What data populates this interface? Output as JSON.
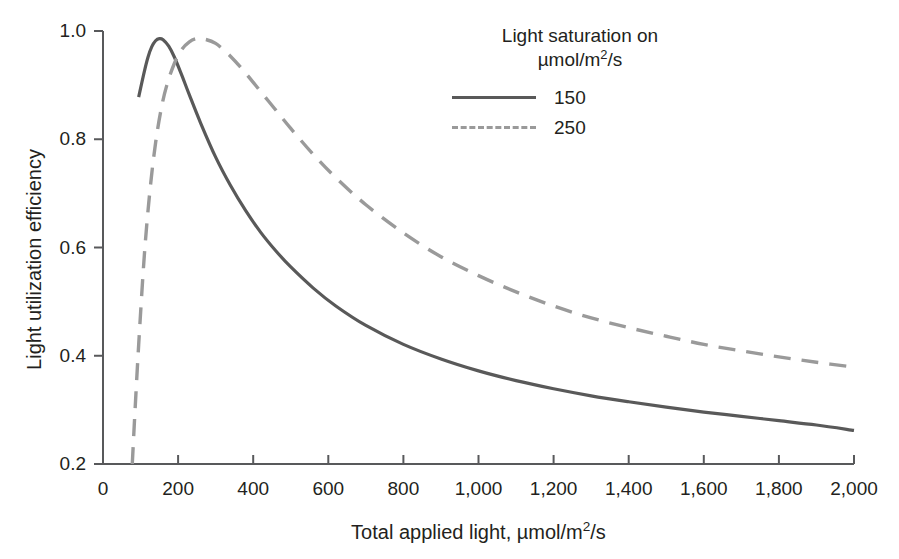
{
  "chart_data": {
    "type": "line",
    "title": "",
    "xlabel": "Total applied light, µmol/m²/s",
    "ylabel": "Light utilization efficiency",
    "xlim": [
      0,
      2000
    ],
    "ylim": [
      0.2,
      1.0
    ],
    "xticks": [
      0,
      200,
      400,
      600,
      800,
      1000,
      1200,
      1400,
      1600,
      1800,
      2000
    ],
    "xtick_labels": [
      "0",
      "200",
      "400",
      "600",
      "800",
      "1,000",
      "1,200",
      "1,400",
      "1,600",
      "1,800",
      "2,000"
    ],
    "yticks": [
      0.2,
      0.4,
      0.6,
      0.8,
      1.0
    ],
    "ytick_labels": [
      "0.2",
      "0.4",
      "0.6",
      "0.8",
      "1.0"
    ],
    "grid": false,
    "legend_position": "top-right",
    "legend_title": [
      "Light saturation on",
      "µmol/m²/s"
    ],
    "series": [
      {
        "name": "150",
        "style": "solid",
        "color": "#595959",
        "x": [
          95,
          110,
          120,
          130,
          140,
          150,
          160,
          175,
          190,
          210,
          230,
          260,
          300,
          340,
          380,
          420,
          460,
          500,
          560,
          620,
          700,
          800,
          900,
          1000,
          1100,
          1200,
          1300,
          1400,
          1500,
          1600,
          1700,
          1800,
          1900,
          2000
        ],
        "y": [
          0.878,
          0.925,
          0.952,
          0.971,
          0.982,
          0.986,
          0.984,
          0.972,
          0.952,
          0.918,
          0.882,
          0.83,
          0.767,
          0.714,
          0.668,
          0.628,
          0.594,
          0.564,
          0.525,
          0.492,
          0.456,
          0.421,
          0.394,
          0.372,
          0.354,
          0.339,
          0.326,
          0.315,
          0.305,
          0.296,
          0.288,
          0.28,
          0.272,
          0.262
        ]
      },
      {
        "name": "250",
        "style": "dashed",
        "color": "#9a9a9a",
        "x": [
          78,
          85,
          95,
          110,
          125,
          140,
          155,
          170,
          190,
          210,
          230,
          250,
          270,
          300,
          340,
          380,
          420,
          460,
          500,
          560,
          620,
          700,
          800,
          900,
          1000,
          1100,
          1200,
          1300,
          1400,
          1500,
          1600,
          1700,
          1800,
          1900,
          2000
        ],
        "y": [
          0.2,
          0.295,
          0.42,
          0.585,
          0.705,
          0.793,
          0.856,
          0.9,
          0.94,
          0.966,
          0.98,
          0.986,
          0.985,
          0.977,
          0.953,
          0.922,
          0.888,
          0.854,
          0.82,
          0.772,
          0.729,
          0.679,
          0.627,
          0.583,
          0.548,
          0.518,
          0.492,
          0.47,
          0.452,
          0.436,
          0.421,
          0.409,
          0.398,
          0.388,
          0.379
        ]
      }
    ],
    "colors": {
      "axis": "#58595b",
      "series_150": "#595959",
      "series_250": "#9a9a9a",
      "text": "#231f20"
    }
  }
}
